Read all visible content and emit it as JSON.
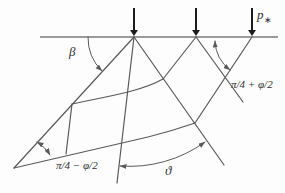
{
  "figure": {
    "width": 285,
    "height": 193,
    "background_color": "#fdfdfd",
    "line_color": "#5a5a5a",
    "surface_color": "#7a7a7a",
    "arrow_color": "#1c1c1c",
    "label_color": "#2e2e2e"
  },
  "labels": {
    "beta": "β",
    "theta": "ϑ",
    "right_wedge_angle": "π/4 + φ/2",
    "left_wedge_angle": "π/4 − φ/2",
    "load_symbol": "p",
    "load_subscript": "∗"
  },
  "geometry": {
    "ground_surface": "M 40 37 L 278 37",
    "load_arrows": [
      {
        "x": 134,
        "top": 8,
        "shaft_bottom": 30,
        "tip": 36,
        "half_width": 4
      },
      {
        "x": 196,
        "top": 8,
        "shaft_bottom": 30,
        "tip": 36,
        "half_width": 4
      },
      {
        "x": 252,
        "top": 8,
        "shaft_bottom": 30,
        "tip": 36,
        "half_width": 4
      }
    ],
    "slip_lines": [
      {
        "name": "left-boundary-line",
        "d": "M 134 37 L 14 168"
      },
      {
        "name": "fan-vertical-line",
        "d": "M 134 37 L 117 183"
      },
      {
        "name": "fan-diagonal-line",
        "d": "M 134 37 L 224 165"
      },
      {
        "name": "wedge-left-line",
        "d": "M 196 37 L 163 79"
      },
      {
        "name": "wedge-right-line",
        "d": "M 196 37 L 243 102"
      },
      {
        "name": "right-boundary-line",
        "d": "M 252 37 L 195 123"
      },
      {
        "name": "bottom-slip-surface",
        "d": "M 14 168 L 148 137 Q 172 131 195 123"
      },
      {
        "name": "block-edge-line",
        "d": "M 72 104 L 66 154"
      },
      {
        "name": "inner-slip-curve",
        "d": "M 72 104 C 104 97 140 92 163 79"
      }
    ],
    "angle_arcs": [
      {
        "name": "beta-angle-arc",
        "d": "M 88 37 A 46 46 0 0 0 102 71",
        "start_arrow": false,
        "end_arrow": true
      },
      {
        "name": "right-angle-arc",
        "d": "M 215 41 A 38 38 0 0 0 230 70",
        "start_arrow": true,
        "end_arrow": true
      },
      {
        "name": "apex-angle-arc",
        "d": "M 37 142 A 36 36 0 0 1 50 155",
        "start_arrow": true,
        "end_arrow": true
      },
      {
        "name": "theta-angle-arc",
        "d": "M 120 166 A 128 128 0 0 0 205 142",
        "start_arrow": true,
        "end_arrow": true
      }
    ]
  }
}
